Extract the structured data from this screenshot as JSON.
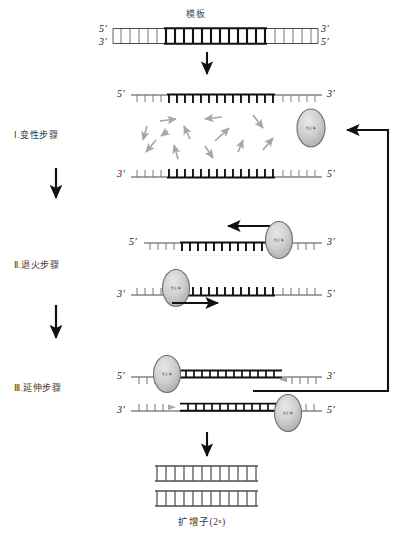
{
  "diagram": {
    "title": "模板",
    "caption": "扩增子(2ⁿ)",
    "polymerase_label": "聚合酶",
    "steps": [
      {
        "id": "denaturation",
        "label": "Ⅰ.变性步骤"
      },
      {
        "id": "annealing",
        "label": "Ⅱ.退火步骤"
      },
      {
        "id": "extension",
        "label": "Ⅲ.延伸步骤"
      }
    ],
    "end_labels": {
      "five_prime": "5'",
      "three_prime": "3'"
    },
    "rows": {
      "template_duplex": {
        "top_left": "5'",
        "top_right": "3'",
        "bottom_left": "3'",
        "bottom_right": "5'"
      },
      "denatured_top": {
        "left": "5'",
        "right": "3'"
      },
      "denatured_bottom": {
        "left": "3'",
        "right": "5'"
      },
      "annealing_top": {
        "left": "5'",
        "right": "3'"
      },
      "annealing_bottom": {
        "left": "3'",
        "right": "5'"
      },
      "extension_top": {
        "left": "5'",
        "right": "3'"
      },
      "extension_bottom": {
        "left": "3'",
        "right": "5'"
      }
    },
    "colors": {
      "stroke": "#1a1a1a",
      "strand": "#555555",
      "accent_gray": "#9a9a9a",
      "oval_fill": "#c8c8c8",
      "oval_stroke": "#6e6e6e",
      "text": "#2b2b2b",
      "background": "#ffffff"
    },
    "nucleotide_arrow_count": 12,
    "product_duplex_count": 2
  }
}
